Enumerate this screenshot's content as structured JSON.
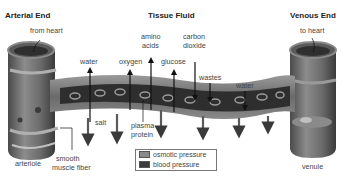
{
  "headers": {
    "arterial": "Arterial End",
    "tissue": "Tissue Fluid",
    "venous": "Venous End"
  },
  "labels": {
    "from_heart": "from heart",
    "to_heart": "to heart",
    "water_left": "water",
    "oxygen": "oxygen",
    "amino_acids_1": "amino",
    "amino_acids_2": "acids",
    "glucose": "glucose",
    "carbon_dioxide_1": "carbon",
    "carbon_dioxide_2": "dioxide",
    "wastes": "wastes",
    "water_right": "water",
    "salt": "salt",
    "plasma_protein_1": "plasma",
    "plasma_protein_2": "protein",
    "arteriole": "arteriole",
    "smooth_muscle_1": "smooth",
    "smooth_muscle_2": "muscle fiber",
    "venule": "venule"
  },
  "legend": {
    "items": [
      {
        "label": "osmotic pressure",
        "color": "#8a8a8a"
      },
      {
        "label": "blood pressure",
        "color": "#3a3a3a"
      }
    ]
  },
  "colors": {
    "vessel": "#6e6e6e",
    "vessel_dark": "#3c3c3c",
    "vessel_light": "#a8a8a8",
    "arrow": "#222222",
    "arrow_gray": "#5a5a5a"
  }
}
